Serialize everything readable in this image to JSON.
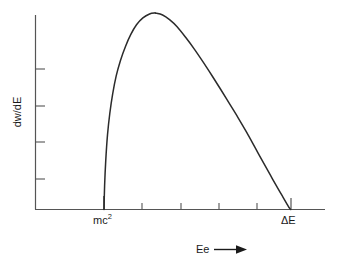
{
  "figure": {
    "name": "beta-decay-energy-spectrum",
    "background_color": "#ffffff",
    "curve_color": "#2b2b2b",
    "axis_color": "#555555",
    "text_color": "#1a1a1a"
  },
  "labels": {
    "y_axis": "dw/dE",
    "x_axis_title": "Ee",
    "x_axis_arrow": "arrow-right-icon",
    "x_tick_low": "mc",
    "x_tick_low_sup": "2",
    "x_tick_high": "ΔE"
  },
  "chart_data": {
    "type": "line",
    "title": "",
    "xlabel": "Ee",
    "ylabel": "dw/dE",
    "grid": false,
    "legend": "none",
    "xlim": [
      0,
      1
    ],
    "ylim": [
      0,
      1
    ],
    "x_tick_labels": [
      "mc2",
      "ΔE"
    ],
    "x_tick_label_positions": [
      0.238,
      0.882
    ],
    "x_tick_positions": [
      0.238,
      0.369,
      0.507,
      0.638,
      0.769,
      0.882
    ],
    "y_tick_positions": [
      0.155,
      0.345,
      0.53,
      0.72
    ],
    "annotations": [
      {
        "text": "mc2",
        "x": 0.238,
        "y": -0.06
      },
      {
        "text": "ΔE",
        "x": 0.882,
        "y": -0.06
      }
    ],
    "series": [
      {
        "name": "beta spectrum dw/dE",
        "x": [
          0.238,
          0.24,
          0.244,
          0.25,
          0.258,
          0.268,
          0.28,
          0.295,
          0.312,
          0.33,
          0.35,
          0.372,
          0.395,
          0.415,
          0.414,
          0.44,
          0.465,
          0.49,
          0.52,
          0.55,
          0.58,
          0.61,
          0.64,
          0.67,
          0.7,
          0.73,
          0.76,
          0.79,
          0.815,
          0.838,
          0.855,
          0.868,
          0.876,
          0.882
        ],
        "y": [
          0.0,
          0.12,
          0.25,
          0.38,
          0.49,
          0.59,
          0.68,
          0.76,
          0.83,
          0.89,
          0.94,
          0.975,
          0.995,
          1.0,
          1.0,
          0.99,
          0.965,
          0.93,
          0.875,
          0.815,
          0.75,
          0.682,
          0.612,
          0.54,
          0.468,
          0.392,
          0.312,
          0.232,
          0.166,
          0.106,
          0.063,
          0.03,
          0.01,
          0.0
        ],
        "peak": {
          "x": 0.415,
          "y": 1.0
        },
        "endpoint_zero": {
          "x": 0.882,
          "y": 0.0
        },
        "threshold_zero": {
          "x": 0.238,
          "y": 0.0
        }
      }
    ]
  }
}
